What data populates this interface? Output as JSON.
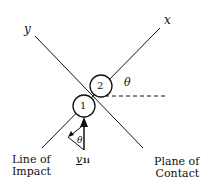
{
  "diagram": {
    "axis_labels": {
      "y": "y",
      "x": "x"
    },
    "angle_label": "θ",
    "angle_label_small": "θ",
    "particles": [
      {
        "label": "1"
      },
      {
        "label": "2"
      }
    ],
    "velocity_label": {
      "base": "v",
      "subscript": "1i"
    },
    "line_of_impact": {
      "line1": "Line of",
      "line2": "Impact"
    },
    "plane_of_contact": {
      "line1": "Plane of",
      "line2": "Contact"
    },
    "colors": {
      "stroke": "#111111",
      "background": "#ffffff"
    }
  }
}
